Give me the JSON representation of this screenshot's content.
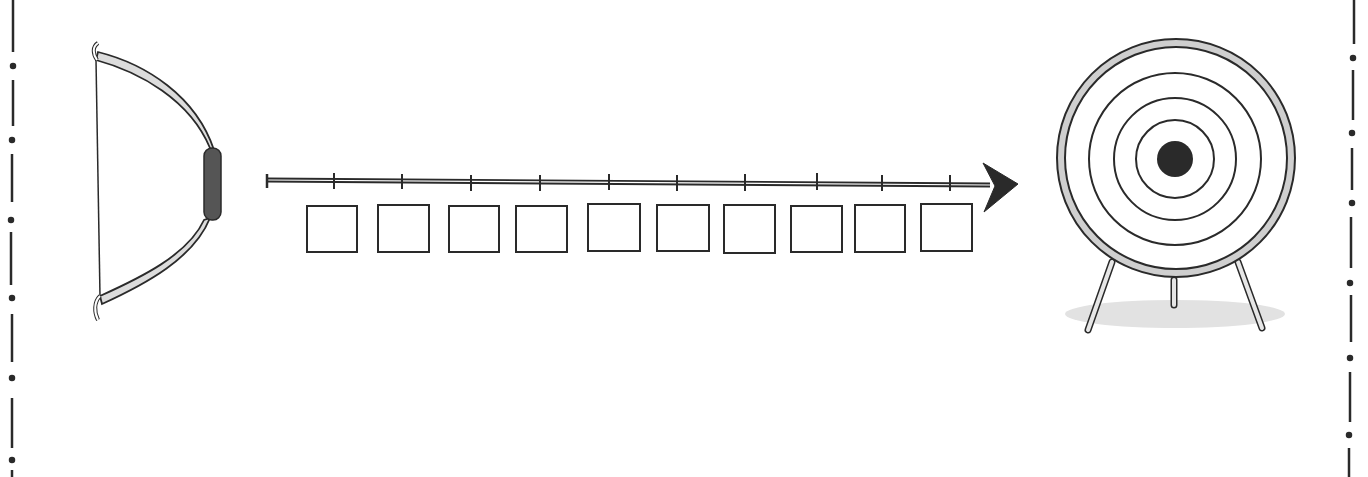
{
  "diagram": {
    "type": "illustration",
    "elements": {
      "bow": {
        "label": ""
      },
      "arrow": {
        "tick_count": 10
      },
      "steps": {
        "count": 10,
        "labels": [
          "",
          "",
          "",
          "",
          "",
          "",
          "",
          "",
          "",
          ""
        ]
      },
      "target": {
        "rings": 4,
        "bullseye": true,
        "legs": 3
      }
    },
    "border": {
      "style": "dash-dot",
      "sides": [
        "left",
        "right"
      ]
    },
    "colors": {
      "ink": "#2a2a2a",
      "bow_fill": "#dcdcdc",
      "grip": "#555555",
      "rim": "#cfcfcf",
      "shadow": "#e2e2e2"
    }
  }
}
